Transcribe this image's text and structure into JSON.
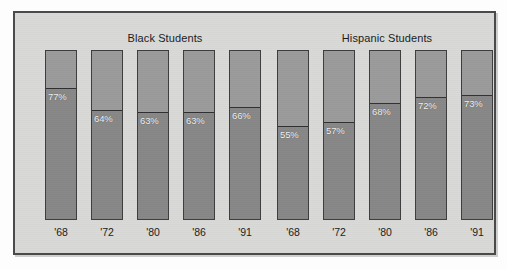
{
  "chart_data": {
    "type": "bar",
    "title": "",
    "xlabel": "",
    "ylabel": "",
    "ylim": [
      0,
      100
    ],
    "grid": false,
    "legend": "none",
    "orientation": "vertical",
    "stacked": true,
    "note": "Each bar is a full-height column split into a lower shaded portion whose height equals the labeled percentage; the percentage label sits just below the split line inside the bar.",
    "groups": [
      {
        "name": "Black Students",
        "categories": [
          "'68",
          "'72",
          "'80",
          "'86",
          "'91"
        ],
        "values": [
          77,
          64,
          63,
          63,
          66
        ],
        "value_labels": [
          "77%",
          "64%",
          "63%",
          "63%",
          "66%"
        ]
      },
      {
        "name": "Hispanic Students",
        "categories": [
          "'68",
          "'72",
          "'80",
          "'86",
          "'91"
        ],
        "values": [
          55,
          57,
          68,
          72,
          73
        ],
        "value_labels": [
          "55%",
          "57%",
          "68%",
          "72%",
          "73%"
        ]
      }
    ],
    "colors": {
      "panel_background": "#d9d9d7",
      "bar_upper": "#9b9b9b",
      "bar_lower": "#878787",
      "bar_border": "#3d3d3d",
      "label_text": "#f4f4f4",
      "axis_text": "#1b1b1b"
    }
  }
}
